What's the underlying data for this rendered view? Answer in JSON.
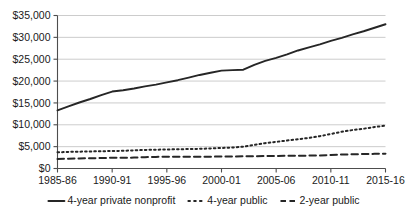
{
  "chart_data": {
    "type": "line",
    "title": "",
    "subtitle": "",
    "xlabel": "",
    "ylabel": "",
    "ylim": [
      0,
      35000
    ],
    "ytick_values": [
      0,
      5000,
      10000,
      15000,
      20000,
      25000,
      30000,
      35000
    ],
    "ytick_labels": [
      "$0",
      "$5,000",
      "$10,000",
      "$15,000",
      "$20,000",
      "$25,000",
      "$30,000",
      "$35,000"
    ],
    "grid": true,
    "grid_axis": "y",
    "legend_position": "bottom",
    "x": [
      "1985-86",
      "1986-87",
      "1987-88",
      "1988-89",
      "1989-90",
      "1990-91",
      "1991-92",
      "1992-93",
      "1993-94",
      "1994-95",
      "1995-96",
      "1996-97",
      "1997-98",
      "1998-99",
      "1999-00",
      "2000-01",
      "2001-02",
      "2002-03",
      "2003-04",
      "2004-05",
      "2005-06",
      "2006-07",
      "2007-08",
      "2008-09",
      "2009-10",
      "2010-11",
      "2011-12",
      "2012-13",
      "2013-14",
      "2014-15",
      "2015-16"
    ],
    "xtick_labels": [
      "1985-86",
      "1990-91",
      "1995-96",
      "2000-01",
      "2005-06",
      "2010-11",
      "2015-16"
    ],
    "xtick_indices": [
      0,
      5,
      10,
      15,
      20,
      25,
      30
    ],
    "series": [
      {
        "name": "4-year private nonprofit",
        "style": "solid",
        "color": "#262626",
        "values": [
          13300,
          14200,
          15100,
          15900,
          16800,
          17600,
          17900,
          18300,
          18800,
          19200,
          19700,
          20200,
          20800,
          21400,
          21900,
          22400,
          22500,
          22600,
          23700,
          24600,
          25300,
          26100,
          27000,
          27700,
          28400,
          29200,
          29900,
          30700,
          31400,
          32200,
          33000
        ]
      },
      {
        "name": "4-year public",
        "style": "dotted",
        "color": "#262626",
        "values": [
          3700,
          3800,
          3850,
          3900,
          3950,
          4000,
          4050,
          4150,
          4250,
          4300,
          4350,
          4400,
          4450,
          4500,
          4600,
          4700,
          4800,
          5000,
          5400,
          5800,
          6100,
          6400,
          6700,
          7000,
          7400,
          7900,
          8400,
          8800,
          9100,
          9500,
          9800
        ]
      },
      {
        "name": "2-year public",
        "style": "dashed",
        "color": "#262626",
        "values": [
          2200,
          2250,
          2300,
          2350,
          2400,
          2450,
          2450,
          2500,
          2600,
          2650,
          2700,
          2700,
          2700,
          2700,
          2700,
          2750,
          2750,
          2800,
          2800,
          2850,
          2850,
          2900,
          2900,
          2950,
          3000,
          3100,
          3200,
          3250,
          3300,
          3350,
          3400
        ]
      }
    ]
  },
  "legend": {
    "items": [
      {
        "label": "4-year private nonprofit",
        "style": "solid"
      },
      {
        "label": "4-year public",
        "style": "dotted"
      },
      {
        "label": "2-year public",
        "style": "dashed"
      }
    ]
  }
}
